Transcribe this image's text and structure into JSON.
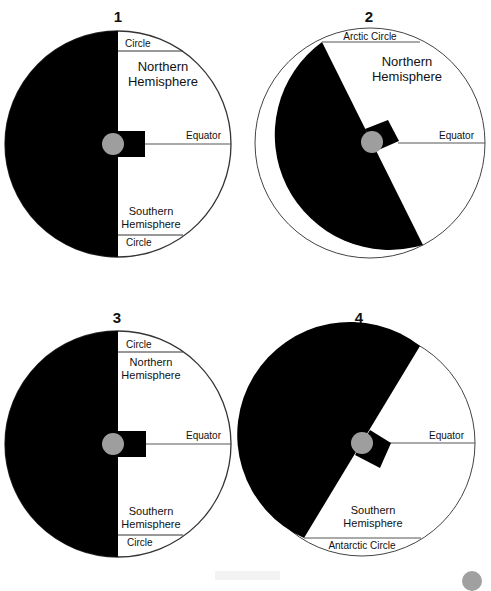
{
  "diagrams": [
    {
      "number": "1",
      "labels": {
        "top_circle": "Circle",
        "north": [
          "Northern",
          "Hemisphere"
        ],
        "equator": "Equator",
        "south": [
          "Southern",
          "Hemisphere"
        ],
        "bottom_circle": "Circle"
      }
    },
    {
      "number": "2",
      "labels": {
        "top_circle": "Arctic Circle",
        "north": [
          "Northern",
          "Hemisphere"
        ],
        "equator": "Equator"
      }
    },
    {
      "number": "3",
      "labels": {
        "top_circle": "Circle",
        "north": [
          "Northern",
          "Hemisphere"
        ],
        "equator": "Equator",
        "south": [
          "Southern",
          "Hemisphere"
        ],
        "bottom_circle": "Circle"
      }
    },
    {
      "number": "4",
      "labels": {
        "equator": "Equator",
        "south": [
          "Southern",
          "Hemisphere"
        ],
        "bottom_circle": "Antarctic Circle"
      }
    }
  ],
  "colors": {
    "night": "#000000",
    "day": "#ffffff",
    "sun_marker": "#9e9e9e",
    "outline": "#333333"
  }
}
